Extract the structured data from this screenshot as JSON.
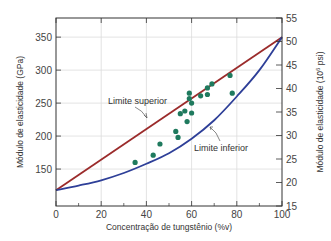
{
  "chart_data": {
    "type": "scatter",
    "title": "",
    "xlabel": "Concentração de tungstênio (%v)",
    "ylabel": "Módulo de elasticidade (GPa)",
    "ylabel_right": "Módulo de elasticidade (10^6 psi)",
    "ylabel_right_parts": {
      "prefix": "Módulo de elasticidade (10",
      "sup": "6",
      "suffix": " psi)"
    },
    "xlim": [
      0,
      100
    ],
    "ylim": [
      94,
      379
    ],
    "ylim_right": [
      15,
      55
    ],
    "grid": true,
    "x_ticks": [
      0,
      20,
      40,
      60,
      80,
      100
    ],
    "x_minor_ticks": [
      10,
      30,
      50,
      70,
      90
    ],
    "y_ticks": [
      150,
      200,
      250,
      300,
      350
    ],
    "y_right_ticks": [
      15,
      20,
      25,
      30,
      35,
      40,
      45,
      50,
      55
    ],
    "series": [
      {
        "name": "Limite superior",
        "kind": "line",
        "color": "#9b2b2b",
        "x": [
          0,
          100
        ],
        "y": [
          118,
          350
        ]
      },
      {
        "name": "Limite inferior",
        "kind": "line",
        "color": "#2e3f98",
        "x": [
          0,
          10,
          20,
          30,
          40,
          50,
          60,
          70,
          80,
          90,
          100
        ],
        "y": [
          118,
          125,
          133,
          144,
          158,
          174,
          196,
          224,
          260,
          300,
          350
        ]
      },
      {
        "name": "Dados experimentais",
        "kind": "scatter",
        "color": "#1f7a5e",
        "x": [
          35,
          43,
          46,
          53,
          54,
          55,
          57,
          58,
          59,
          59,
          60,
          60,
          64,
          67,
          67,
          69,
          77,
          78
        ],
        "y": [
          160,
          171,
          188,
          207,
          198,
          234,
          238,
          222,
          265,
          257,
          250,
          235,
          261,
          273,
          263,
          279,
          292,
          265
        ]
      }
    ],
    "annotations": [
      {
        "text": "Limite superior",
        "target_series": "Limite superior",
        "x": 108,
        "y": 101
      },
      {
        "text": "Limite inferior",
        "target_series": "Limite inferior",
        "x": 194,
        "y": 149
      }
    ]
  },
  "labels": {
    "upper_bound": "Limite superior",
    "lower_bound": "Limite inferior",
    "x_axis_title": "Concentração de tungstênio (%v)",
    "y_axis_title": "Módulo de elasticidade (GPa)"
  },
  "colors": {
    "upper_line": "#9b2b2b",
    "lower_line": "#2e3f98",
    "points": "#1f7a5e",
    "grid": "#dcdcdc",
    "axis": "#333333"
  }
}
